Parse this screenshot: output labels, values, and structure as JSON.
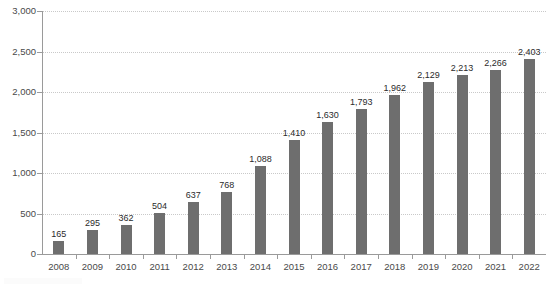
{
  "chart_data": {
    "type": "bar",
    "title": "",
    "subtitle": "",
    "xlabel": "",
    "ylabel": "",
    "categories": [
      "2008",
      "2009",
      "2010",
      "2011",
      "2012",
      "2013",
      "2014",
      "2015",
      "2016",
      "2017",
      "2018",
      "2019",
      "2020",
      "2021",
      "2022"
    ],
    "values": [
      165,
      295,
      362,
      504,
      637,
      768,
      1088,
      1410,
      1630,
      1793,
      1962,
      2129,
      2213,
      2266,
      2403
    ],
    "data_labels": [
      "165",
      "295",
      "362",
      "504",
      "637",
      "768",
      "1,088",
      "1,410",
      "1,630",
      "1,793",
      "1,962",
      "2,129",
      "2,213",
      "2,266",
      "2,403"
    ],
    "ylim": [
      0,
      3000
    ],
    "y_ticks": [
      0,
      500,
      1000,
      1500,
      2000,
      2500,
      3000
    ],
    "y_tick_labels": [
      "0",
      "500",
      "1,000",
      "1,500",
      "2,000",
      "2,500",
      "3,000"
    ],
    "grid": true,
    "grid_style": "dotted",
    "legend": "none",
    "series": [
      {
        "name": "",
        "values": [
          165,
          295,
          362,
          504,
          637,
          768,
          1088,
          1410,
          1630,
          1793,
          1962,
          2129,
          2213,
          2266,
          2403
        ]
      }
    ],
    "colors": {
      "bar": "#6e6e6e",
      "grid": "#c9c9c9",
      "axis": "#9a9a9a",
      "tick_label": "#4a4a4a",
      "data_label": "#2b2b2b",
      "background": "#ffffff"
    }
  }
}
